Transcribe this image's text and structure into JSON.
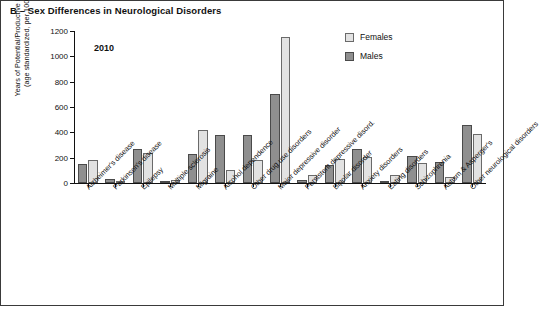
{
  "panel": {
    "title": "B – Sex Differences in Neurological Disorders",
    "annotation": "2010"
  },
  "legend": {
    "position": "top-right",
    "items": [
      {
        "label": "Females",
        "color": "#e2e2e2",
        "swatch": "females-swatch"
      },
      {
        "label": "Males",
        "color": "#8f8f8f",
        "swatch": "males-swatch"
      }
    ]
  },
  "axes": {
    "y_title": "Years of Potential/Productive Life Lost\n(age standardized, per 100,000)",
    "y_ticks": [
      "0",
      "200",
      "400",
      "600",
      "800",
      "1000",
      "1200"
    ]
  },
  "chart_data": {
    "type": "bar",
    "title": "B – Sex Differences in Neurological Disorders",
    "subtitle": "2010",
    "xlabel": "",
    "ylabel": "Years of Potential/Productive Life Lost (age standardized, per 100,000)",
    "ylim": [
      0,
      1200
    ],
    "ytick_step": 200,
    "grid": false,
    "legend_position": "top-right",
    "bar_order_within_group": [
      "Males",
      "Females"
    ],
    "categories": [
      "Alzheimer's disease",
      "Parkinson's disease",
      "Epilepsy",
      "Multiple sclerosis",
      "Migraine",
      "Alcohol dependence",
      "Other drug use disorders",
      "Major depressive disorder",
      "Persistent depressive disord.",
      "Bipolar disorder",
      "Anxiety disorders",
      "Eating disorders",
      "Schizophrenia",
      "Autism & Asperger's",
      "Other neurological disorders"
    ],
    "series": [
      {
        "name": "Males",
        "color": "#8f8f8f",
        "values": [
          150,
          30,
          270,
          10,
          230,
          380,
          380,
          700,
          25,
          140,
          270,
          5,
          215,
          165,
          455
        ]
      },
      {
        "name": "Females",
        "color": "#e2e2e2",
        "values": [
          180,
          15,
          235,
          20,
          420,
          100,
          185,
          1150,
          60,
          190,
          205,
          65,
          155,
          45,
          390
        ]
      }
    ]
  }
}
